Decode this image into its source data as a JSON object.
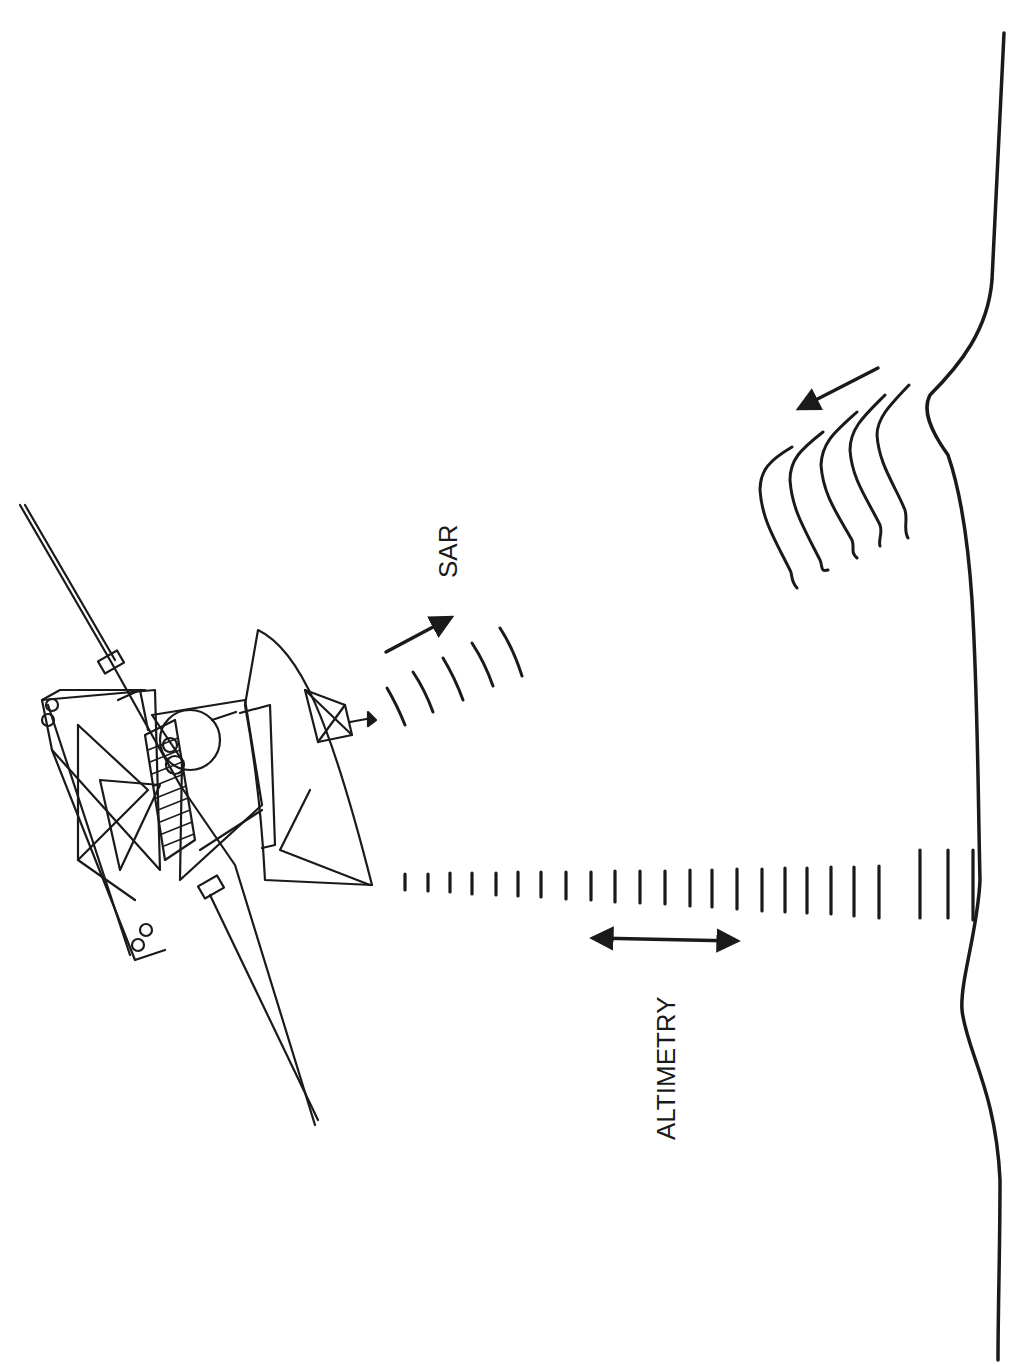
{
  "diagram": {
    "type": "illustration",
    "labels": {
      "sar": "SAR",
      "altimetry": "ALTIMETRY"
    },
    "elements": [
      {
        "name": "spacecraft",
        "kind": "line-art"
      },
      {
        "name": "sar-beam",
        "kind": "arc-pulses",
        "count": 5
      },
      {
        "name": "sar-direction-arrow",
        "kind": "arrow"
      },
      {
        "name": "altimetry-beam",
        "kind": "tick-pulses",
        "count": 21
      },
      {
        "name": "altimetry-double-arrow",
        "kind": "double-arrow"
      },
      {
        "name": "surface-profile",
        "kind": "curve"
      },
      {
        "name": "backscatter-waves",
        "kind": "wavy-lines",
        "count": 5
      },
      {
        "name": "backscatter-arrow",
        "kind": "arrow"
      }
    ],
    "colors": {
      "ink": "#1a1a1a",
      "background": "#ffffff"
    }
  }
}
